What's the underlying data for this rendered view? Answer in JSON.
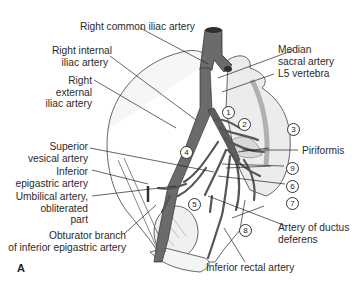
{
  "figure": {
    "panel_label": "A",
    "labels": {
      "right_common_iliac": "Right common iliac artery",
      "right_internal_iliac": [
        "Right internal",
        "iliac artery"
      ],
      "right_external_iliac": [
        "Right",
        "external",
        "iliac artery"
      ],
      "superior_vesical": [
        "Superior",
        "vesical artery"
      ],
      "inferior_epigastric": [
        "Inferior",
        "epigastric artery"
      ],
      "umbilical": [
        "Umbilical artery,",
        "obliterated",
        "part"
      ],
      "obturator_branch": [
        "Obturator branch",
        "of inferior epigastric artery"
      ],
      "median_sacral": [
        "Median",
        "sacral artery"
      ],
      "l5_vertebra": "L5 vertebra",
      "piriformis": "Piriformis",
      "ductus_deferens": [
        "Artery of ductus",
        "deferens"
      ],
      "inferior_rectal": "Inferior rectal artery"
    },
    "numbers": [
      "1",
      "2",
      "3",
      "4",
      "5",
      "6",
      "7",
      "8",
      "9"
    ],
    "colors": {
      "artery": "#6b6b6b",
      "artery_dark": "#3a3a3a",
      "bone_outline": "#555555",
      "leader": "#222222",
      "background": "#ffffff"
    }
  }
}
